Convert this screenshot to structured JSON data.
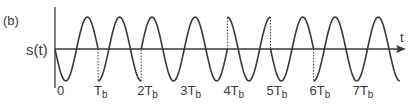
{
  "figure": {
    "panel_label": "(b)",
    "y_axis_label": "s(t)",
    "x_axis_label": "t",
    "colors": {
      "line": "#3a3a3a",
      "background": "#ffffff"
    },
    "tick_labels": [
      {
        "main": "0",
        "sub": ""
      },
      {
        "main": "T",
        "sub": "b"
      },
      {
        "main": "2T",
        "sub": "b"
      },
      {
        "main": "3T",
        "sub": "b"
      },
      {
        "main": "4T",
        "sub": "b"
      },
      {
        "main": "5T",
        "sub": "b"
      },
      {
        "main": "6T",
        "sub": "b"
      },
      {
        "main": "7T",
        "sub": "b"
      }
    ],
    "bit_segments": [
      {
        "index": 0,
        "waveform": "-sin"
      },
      {
        "index": 1,
        "waveform": "-cos"
      },
      {
        "index": 2,
        "waveform": "sin"
      },
      {
        "index": 3,
        "waveform": "sin"
      },
      {
        "index": 4,
        "waveform": "cos"
      },
      {
        "index": 5,
        "waveform": "-sin"
      },
      {
        "index": 6,
        "waveform": "-cos"
      },
      {
        "index": 7,
        "waveform": "-cos"
      }
    ],
    "phase_discontinuities_dotted_at": [
      "T_b",
      "2T_b",
      "4T_b",
      "5T_b",
      "6T_b"
    ]
  }
}
